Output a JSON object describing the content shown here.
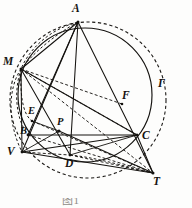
{
  "figure": {
    "name": "circle-geometry-figure",
    "kind": "euclidean-geometry-diagram",
    "caption": "图1",
    "background_color": "#fdfdfc",
    "ink_color": "#14120f"
  },
  "labels": {
    "A": "A",
    "M": "M",
    "E": "E",
    "B": "B",
    "V": "V",
    "P": "P",
    "D": "D",
    "C": "C",
    "F": "F",
    "T": "T",
    "Gamma": "Γ"
  },
  "points": {
    "A": {
      "label": "A",
      "x": 78,
      "y": 22,
      "label_x": 72,
      "label_y": 3
    },
    "M": {
      "label": "M",
      "x": 21,
      "y": 69,
      "label_x": 3,
      "label_y": 56
    },
    "E": {
      "label": "E",
      "x": 32,
      "y": 121,
      "label_x": 28,
      "label_y": 107
    },
    "B": {
      "label": "B",
      "x": 28,
      "y": 135,
      "label_x": 20,
      "label_y": 126
    },
    "V": {
      "label": "V",
      "x": 22,
      "y": 152,
      "label_x": 9,
      "label_y": 147
    },
    "P": {
      "label": "P",
      "x": 59,
      "y": 131,
      "label_x": 58,
      "label_y": 117
    },
    "D": {
      "label": "D",
      "x": 70,
      "y": 155,
      "label_x": 66,
      "label_y": 158
    },
    "C": {
      "label": "C",
      "x": 137,
      "y": 135,
      "label_x": 142,
      "label_y": 131
    },
    "F": {
      "label": "F",
      "x": 122,
      "y": 104,
      "label_x": 123,
      "label_y": 91
    },
    "T": {
      "label": "T",
      "x": 153,
      "y": 173,
      "label_x": 154,
      "label_y": 176
    },
    "Gamma": {
      "label": "Γ",
      "x": 160,
      "y": 88,
      "label_x": 159,
      "label_y": 79
    }
  },
  "circles": [
    {
      "name": "inner-circle-solid",
      "cx": 85,
      "cy": 95,
      "r": 67,
      "style": "solid"
    },
    {
      "name": "outer-circle-gamma",
      "cx": 88,
      "cy": 100,
      "r": 78,
      "style": "dashed"
    }
  ],
  "segments": [
    {
      "name": "segment-A-V",
      "from": "A",
      "to": "V",
      "style": "solid"
    },
    {
      "name": "segment-A-D",
      "from": "A",
      "to": "D",
      "style": "solid"
    },
    {
      "name": "segment-A-B",
      "from": "A",
      "to": "B",
      "style": "solid"
    },
    {
      "name": "segment-A-T",
      "from": "A",
      "to": "T",
      "style": "solid"
    },
    {
      "name": "segment-A-M",
      "from": "A",
      "to": "M",
      "style": "solid"
    },
    {
      "name": "segment-M-C",
      "from": "M",
      "to": "C",
      "style": "solid"
    },
    {
      "name": "segment-M-D",
      "from": "M",
      "to": "D",
      "style": "solid"
    },
    {
      "name": "segment-M-V",
      "from": "M",
      "to": "V",
      "style": "solid"
    },
    {
      "name": "segment-B-C",
      "from": "B",
      "to": "C",
      "style": "solid"
    },
    {
      "name": "segment-V-C",
      "from": "V",
      "to": "C",
      "style": "solid"
    },
    {
      "name": "segment-V-T",
      "from": "V",
      "to": "T",
      "style": "solid"
    },
    {
      "name": "segment-C-T",
      "from": "C",
      "to": "T",
      "style": "solid"
    },
    {
      "name": "segment-D-C",
      "from": "D",
      "to": "C",
      "style": "solid"
    },
    {
      "name": "segment-E-P",
      "from": "E",
      "to": "P",
      "style": "solid"
    },
    {
      "name": "segment-P-T",
      "from": "P",
      "to": "T",
      "style": "solid"
    },
    {
      "name": "segment-A-M-dashed",
      "from": "A",
      "to": "M",
      "style": "dashed"
    },
    {
      "name": "segment-M-T-dashed",
      "from": "M",
      "to": "T",
      "style": "dashed"
    },
    {
      "name": "segment-M-P-dashed",
      "from": "M",
      "to": "P",
      "style": "dashed"
    },
    {
      "name": "segment-V-D-dashed",
      "from": "V",
      "to": "D",
      "style": "dashed"
    },
    {
      "name": "segment-D-T-dashed",
      "from": "D",
      "to": "T",
      "style": "dashed"
    },
    {
      "name": "segment-B-T-dashed",
      "from": "B",
      "to": "T",
      "style": "dashed"
    },
    {
      "name": "segment-M-F-dashed",
      "from": "M",
      "to": "F",
      "style": "dashed"
    }
  ]
}
